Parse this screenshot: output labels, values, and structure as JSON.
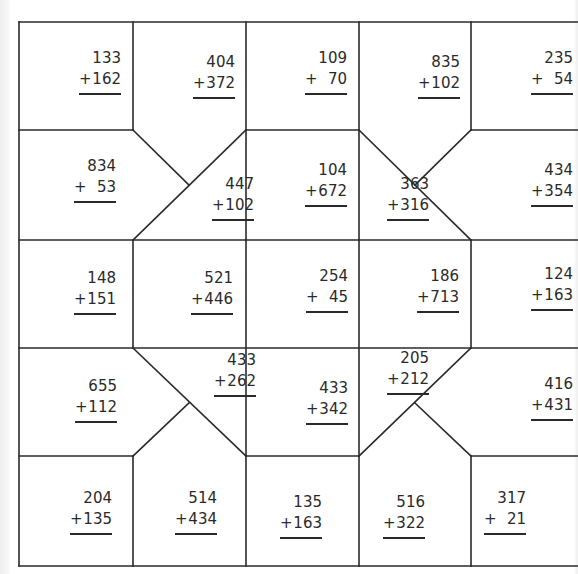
{
  "worksheet": {
    "type": "addition puzzle grid",
    "line_color": "#2a2a2a",
    "problems": [
      {
        "a": "133",
        "b": "162",
        "x": 57,
        "y": 48
      },
      {
        "a": "404",
        "b": "372",
        "x": 171,
        "y": 52
      },
      {
        "a": "109",
        "b": "70",
        "x": 283,
        "y": 48
      },
      {
        "a": "835",
        "b": "102",
        "x": 396,
        "y": 52
      },
      {
        "a": "235",
        "b": "54",
        "x": 509,
        "y": 48
      },
      {
        "a": "834",
        "b": "53",
        "x": 52,
        "y": 156
      },
      {
        "a": "447",
        "b": "102",
        "x": 190,
        "y": 174
      },
      {
        "a": "104",
        "b": "672",
        "x": 283,
        "y": 160
      },
      {
        "a": "363",
        "b": "316",
        "x": 365,
        "y": 174
      },
      {
        "a": "434",
        "b": "354",
        "x": 509,
        "y": 160
      },
      {
        "a": "148",
        "b": "151",
        "x": 52,
        "y": 268
      },
      {
        "a": "521",
        "b": "446",
        "x": 169,
        "y": 268
      },
      {
        "a": "254",
        "b": "45",
        "x": 284,
        "y": 266
      },
      {
        "a": "186",
        "b": "713",
        "x": 395,
        "y": 266
      },
      {
        "a": "124",
        "b": "163",
        "x": 509,
        "y": 264
      },
      {
        "a": "655",
        "b": "112",
        "x": 53,
        "y": 376
      },
      {
        "a": "433",
        "b": "262",
        "x": 192,
        "y": 350
      },
      {
        "a": "433",
        "b": "342",
        "x": 284,
        "y": 378
      },
      {
        "a": "205",
        "b": "212",
        "x": 365,
        "y": 348
      },
      {
        "a": "416",
        "b": "431",
        "x": 509,
        "y": 374
      },
      {
        "a": "204",
        "b": "135",
        "x": 48,
        "y": 488
      },
      {
        "a": "514",
        "b": "434",
        "x": 153,
        "y": 488
      },
      {
        "a": "135",
        "b": "163",
        "x": 258,
        "y": 492
      },
      {
        "a": "516",
        "b": "322",
        "x": 361,
        "y": 492
      },
      {
        "a": "317",
        "b": "21",
        "x": 462,
        "y": 488
      }
    ]
  }
}
